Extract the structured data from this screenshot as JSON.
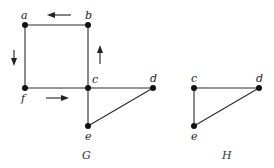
{
  "graphs": [
    {
      "name": "G",
      "nodes": [
        {
          "id": "a",
          "label": "a",
          "x": 25,
          "y": 25
        },
        {
          "id": "b",
          "label": "b",
          "x": 88,
          "y": 25
        },
        {
          "id": "c",
          "label": "c",
          "x": 88,
          "y": 88
        },
        {
          "id": "d",
          "label": "d",
          "x": 153,
          "y": 88
        },
        {
          "id": "e",
          "label": "e",
          "x": 88,
          "y": 126
        },
        {
          "id": "f",
          "label": "f",
          "x": 25,
          "y": 88
        }
      ],
      "edges": [
        [
          "a",
          "b"
        ],
        [
          "b",
          "c"
        ],
        [
          "c",
          "f"
        ],
        [
          "f",
          "a"
        ],
        [
          "c",
          "d"
        ],
        [
          "c",
          "e"
        ],
        [
          "d",
          "e"
        ]
      ],
      "cycle_direction": [
        "f→c",
        "c→b",
        "b→a",
        "a→f"
      ]
    },
    {
      "name": "H",
      "nodes": [
        {
          "id": "c",
          "label": "c",
          "x": 194,
          "y": 88
        },
        {
          "id": "d",
          "label": "d",
          "x": 259,
          "y": 88
        },
        {
          "id": "e",
          "label": "e",
          "x": 194,
          "y": 126
        }
      ],
      "edges": [
        [
          "c",
          "d"
        ],
        [
          "c",
          "e"
        ],
        [
          "d",
          "e"
        ]
      ]
    }
  ]
}
